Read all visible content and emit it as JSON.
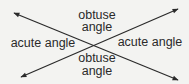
{
  "diagram": {
    "type": "intersecting-lines-angles",
    "lines": [
      {
        "name": "line-a",
        "from": [
          14,
          13
        ],
        "to": [
          178,
          80
        ],
        "arrows": "both"
      },
      {
        "name": "line-b",
        "from": [
          21,
          77
        ],
        "to": [
          178,
          9
        ],
        "arrows": "both"
      }
    ],
    "intersection": [
      97,
      43
    ],
    "labels": {
      "top": {
        "line1": "obtuse",
        "line2": "angle"
      },
      "left": "acute angle",
      "right": "acute angle",
      "bottom": {
        "line1": "obtuse",
        "line2": "angle"
      }
    },
    "colors": {
      "background": "#f3f3f1",
      "line": "#2a2a2a",
      "text": "#2a2a2a"
    }
  }
}
